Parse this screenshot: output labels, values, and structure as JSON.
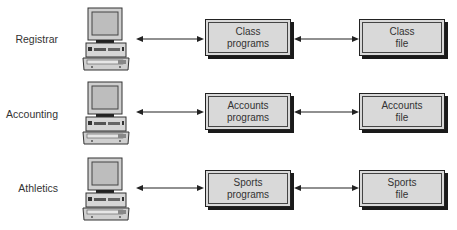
{
  "rows": [
    {
      "department": "Registrar",
      "program": {
        "line1": "Class",
        "line2": "programs"
      },
      "file": {
        "line1": "Class",
        "line2": "file"
      }
    },
    {
      "department": "Accounting",
      "program": {
        "line1": "Accounts",
        "line2": "programs"
      },
      "file": {
        "line1": "Accounts",
        "line2": "file"
      }
    },
    {
      "department": "Athletics",
      "program": {
        "line1": "Sports",
        "line2": "programs"
      },
      "file": {
        "line1": "Sports",
        "line2": "file"
      }
    }
  ],
  "icons": {
    "terminal": "computer-workstation-icon",
    "link": "bidirectional-arrow"
  },
  "colors": {
    "box_fill": "#d9d9d9",
    "box_border": "#222222",
    "arrow": "#222222"
  }
}
